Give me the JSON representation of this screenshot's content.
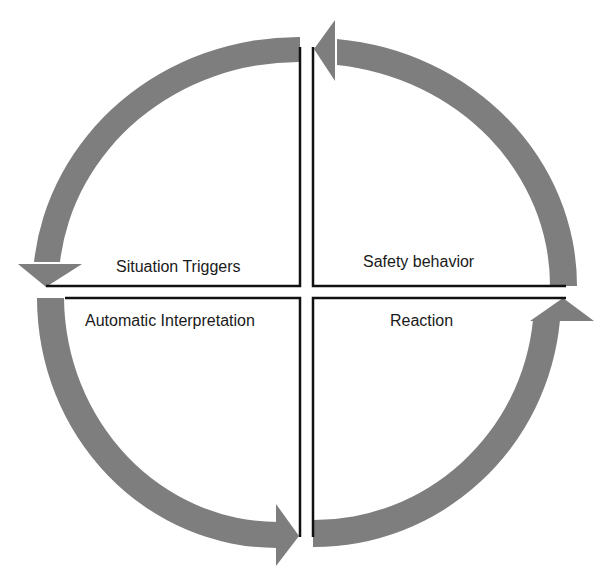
{
  "diagram": {
    "type": "cycle",
    "colors": {
      "arrow": "#7e7e7e",
      "divider": "#111111",
      "text": "#1a1a1a",
      "background": "#ffffff"
    },
    "quadrants": {
      "top_left": {
        "label": "Situation Triggers"
      },
      "top_right": {
        "label": "Safety behavior"
      },
      "bottom_left": {
        "label": "Automatic Interpretation"
      },
      "bottom_right": {
        "label": "Reaction"
      }
    },
    "flow": [
      {
        "from": "Situation Triggers",
        "to": "Automatic Interpretation",
        "arrow": "top-left arc pointing down"
      },
      {
        "from": "Automatic Interpretation",
        "to": "Reaction",
        "arrow": "bottom-left arc pointing right"
      },
      {
        "from": "Reaction",
        "to": "Safety behavior",
        "arrow": "bottom-right arc pointing up"
      },
      {
        "from": "Safety behavior",
        "to": "Situation Triggers",
        "arrow": "top-right arc pointing left"
      }
    ]
  }
}
